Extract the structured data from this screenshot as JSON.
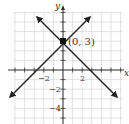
{
  "chart_data": {
    "type": "line",
    "title": "",
    "xlabel": "x",
    "ylabel": "y",
    "xlim": [
      -5,
      6
    ],
    "ylim": [
      -5.5,
      6
    ],
    "grid": true,
    "x_tick_labels": [
      "-2",
      "2"
    ],
    "y_tick_labels": [
      "-2",
      "-4"
    ],
    "series": [
      {
        "name": "y = x + 3",
        "x": [
          -5.7,
          3
        ],
        "y": [
          -2.7,
          5.7
        ],
        "arrows": "both"
      },
      {
        "name": "y = -x + 3",
        "x": [
          -2.7,
          5.7
        ],
        "y": [
          5.7,
          -2.7
        ],
        "arrows": "both"
      }
    ],
    "annotations": [
      {
        "text": "(0, 3)",
        "point": [
          0,
          3
        ],
        "marker": "square"
      }
    ]
  },
  "labels": {
    "x_axis": "x",
    "y_axis": "y",
    "point": "(0, 3)",
    "xtick_neg2": "−2",
    "xtick_2": "2",
    "ytick_neg2": "−2",
    "ytick_neg4": "−4"
  },
  "colors": {
    "grid": "#d6d6d6",
    "axis": "#333333",
    "line": "#222222"
  }
}
